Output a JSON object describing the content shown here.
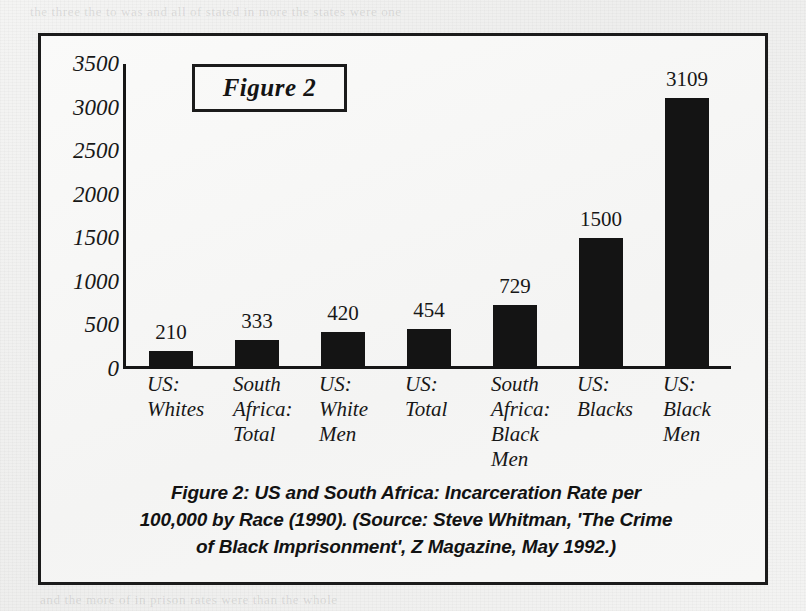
{
  "page": {
    "bleed_through_top": "the three the to was and all of stated in more the states were one",
    "bleed_through_bottom": "and the more of in prison rates were than the whole"
  },
  "figure": {
    "title_box_label": "Figure 2",
    "caption_lines": [
      "Figure 2: US and South Africa: Incarceration Rate per",
      "100,000 by Race (1990). (Source: Steve Whitman, 'The Crime",
      "of Black Imprisonment', Z Magazine, May 1992.)"
    ]
  },
  "chart_data": {
    "type": "bar",
    "title": "Figure 2",
    "caption": "Figure 2: US and South Africa: Incarceration Rate per 100,000 by Race (1990). (Source: Steve Whitman, 'The Crime of Black Imprisonment', Z Magazine, May 1992.)",
    "xlabel": "",
    "ylabel": "",
    "ylim": [
      0,
      3500
    ],
    "ytick_values": [
      0,
      500,
      1000,
      1500,
      2000,
      2500,
      3000,
      3500
    ],
    "ytick_labels": [
      "0",
      "500",
      "1000",
      "1500",
      "2000",
      "2500",
      "3000",
      "3500"
    ],
    "grid": false,
    "legend": false,
    "bar_color": "#141414",
    "categories": [
      "US: Whites",
      "South Africa: Total",
      "US: White Men",
      "US: Total",
      "South Africa: Black Men",
      "US: Blacks",
      "US: Black Men"
    ],
    "category_label_lines": [
      [
        "US:",
        "Whites"
      ],
      [
        "South",
        "Africa:",
        "Total"
      ],
      [
        "US:",
        "White",
        "Men"
      ],
      [
        "US:",
        "Total"
      ],
      [
        "South",
        "Africa:",
        "Black",
        "Men"
      ],
      [
        "US:",
        "Blacks"
      ],
      [
        "US:",
        "Black",
        "Men"
      ]
    ],
    "values": [
      210,
      333,
      420,
      454,
      729,
      1500,
      3109
    ],
    "value_labels": [
      "210",
      "333",
      "420",
      "454",
      "729",
      "1500",
      "3109"
    ]
  }
}
